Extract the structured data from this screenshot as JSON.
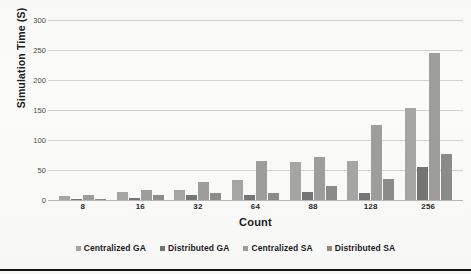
{
  "chart_data": {
    "type": "bar",
    "title": "",
    "xlabel": "Count",
    "ylabel": "Simulation Time (S)",
    "categories": [
      "8",
      "16",
      "32",
      "64",
      "88",
      "128",
      "256"
    ],
    "series": [
      {
        "name": "Centralized GA",
        "color": "#a6a6a4",
        "values": [
          7,
          13,
          16,
          33,
          63,
          65,
          153
        ]
      },
      {
        "name": "Distributed GA",
        "color": "#767674",
        "values": [
          2,
          3,
          9,
          9,
          13,
          12,
          55
        ]
      },
      {
        "name": "Centralized SA",
        "color": "#9e9e9c",
        "values": [
          9,
          16,
          30,
          65,
          72,
          125,
          245
        ]
      },
      {
        "name": "Distributed SA",
        "color": "#8c8c8a",
        "values": [
          1.5,
          8,
          12,
          12,
          23,
          35,
          77
        ]
      }
    ],
    "ylim": [
      0,
      300
    ],
    "yticks": [
      0,
      50,
      100,
      150,
      200,
      250,
      300
    ],
    "ytick_labels": [
      "0",
      "50",
      "100",
      "150",
      "200",
      "250",
      "300"
    ],
    "grid": "horizontal",
    "legend_position": "bottom"
  },
  "legend": {
    "items": [
      {
        "label": "Centralized GA"
      },
      {
        "label": "Distributed GA"
      },
      {
        "label": "Centralized SA"
      },
      {
        "label": "Distributed SA"
      }
    ]
  }
}
